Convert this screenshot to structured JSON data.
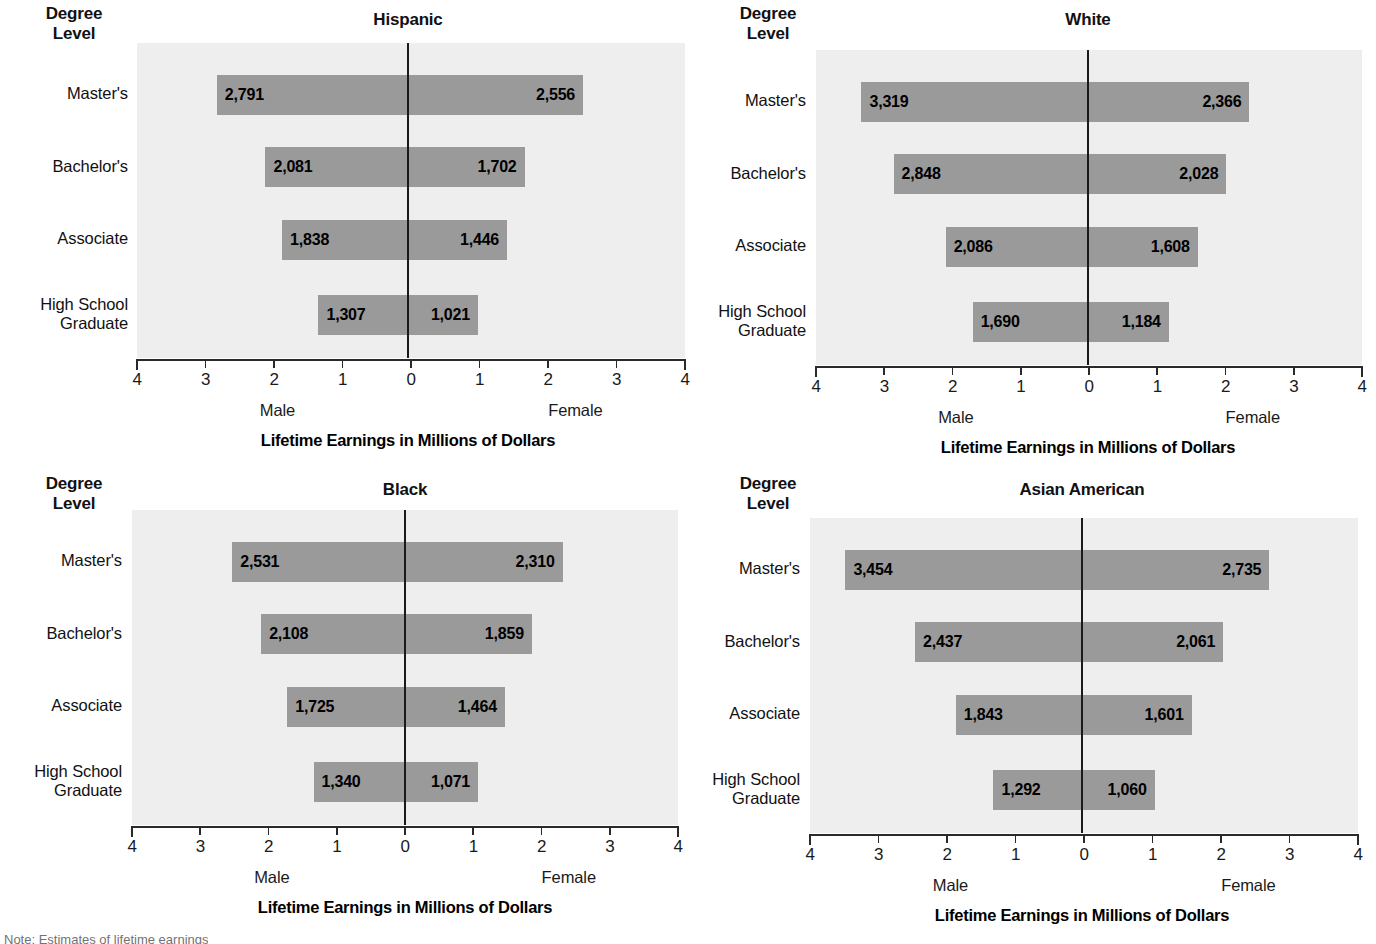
{
  "common": {
    "degree_level_label": "Degree\nLevel",
    "axis_title": "Lifetime Earnings in Millions of Dollars",
    "male_label": "Male",
    "female_label": "Female",
    "tick_labels": [
      "4",
      "3",
      "2",
      "1",
      "0",
      "1",
      "2",
      "3",
      "4"
    ],
    "categories": [
      "Master's",
      "Bachelor's",
      "Associate",
      "High School\nGraduate"
    ],
    "bar_color": "#9a9a9a",
    "plot_bg": "#eeeeee",
    "zero_line_color": "#1a1a1a",
    "axis_color": "#2a2a2a"
  },
  "note": "Note: Estimates of lifetime earnings",
  "chart_data": [
    {
      "type": "bar",
      "title": "Hispanic",
      "xlabel": "Lifetime Earnings in Millions of Dollars",
      "ylabel": "Degree Level",
      "xlim": [
        -4,
        4
      ],
      "grid": false,
      "legend": "none",
      "categories": [
        "Master's",
        "Bachelor's",
        "Associate",
        "High School Graduate"
      ],
      "series": [
        {
          "name": "Male",
          "values": [
            2791,
            2081,
            1838,
            1307
          ],
          "labels": [
            "2,791",
            "2,081",
            "1,838",
            "1,307"
          ]
        },
        {
          "name": "Female",
          "values": [
            2556,
            1702,
            1446,
            1021
          ],
          "labels": [
            "2,556",
            "1,702",
            "1,446",
            "1,021"
          ]
        }
      ]
    },
    {
      "type": "bar",
      "title": "White",
      "xlabel": "Lifetime Earnings in Millions of Dollars",
      "ylabel": "Degree Level",
      "xlim": [
        -4,
        4
      ],
      "grid": false,
      "legend": "none",
      "categories": [
        "Master's",
        "Bachelor's",
        "Associate",
        "High School Graduate"
      ],
      "series": [
        {
          "name": "Male",
          "values": [
            3319,
            2848,
            2086,
            1690
          ],
          "labels": [
            "3,319",
            "2,848",
            "2,086",
            "1,690"
          ]
        },
        {
          "name": "Female",
          "values": [
            2366,
            2028,
            1608,
            1184
          ],
          "labels": [
            "2,366",
            "2,028",
            "1,608",
            "1,184"
          ]
        }
      ]
    },
    {
      "type": "bar",
      "title": "Black",
      "xlabel": "Lifetime Earnings in Millions of Dollars",
      "ylabel": "Degree Level",
      "xlim": [
        -4,
        4
      ],
      "grid": false,
      "legend": "none",
      "categories": [
        "Master's",
        "Bachelor's",
        "Associate",
        "High School Graduate"
      ],
      "series": [
        {
          "name": "Male",
          "values": [
            2531,
            2108,
            1725,
            1340
          ],
          "labels": [
            "2,531",
            "2,108",
            "1,725",
            "1,340"
          ]
        },
        {
          "name": "Female",
          "values": [
            2310,
            1859,
            1464,
            1071
          ],
          "labels": [
            "2,310",
            "1,859",
            "1,464",
            "1,071"
          ]
        }
      ]
    },
    {
      "type": "bar",
      "title": "Asian American",
      "xlabel": "Lifetime Earnings in Millions of Dollars",
      "ylabel": "Degree Level",
      "xlim": [
        -4,
        4
      ],
      "grid": false,
      "legend": "none",
      "categories": [
        "Master's",
        "Bachelor's",
        "Associate",
        "High School Graduate"
      ],
      "series": [
        {
          "name": "Male",
          "values": [
            3454,
            2437,
            1843,
            1292
          ],
          "labels": [
            "3,454",
            "2,437",
            "1,843",
            "1,292"
          ]
        },
        {
          "name": "Female",
          "values": [
            2735,
            2061,
            1601,
            1060
          ],
          "labels": [
            "2,735",
            "2,061",
            "1,601",
            "1,060"
          ]
        }
      ]
    }
  ]
}
